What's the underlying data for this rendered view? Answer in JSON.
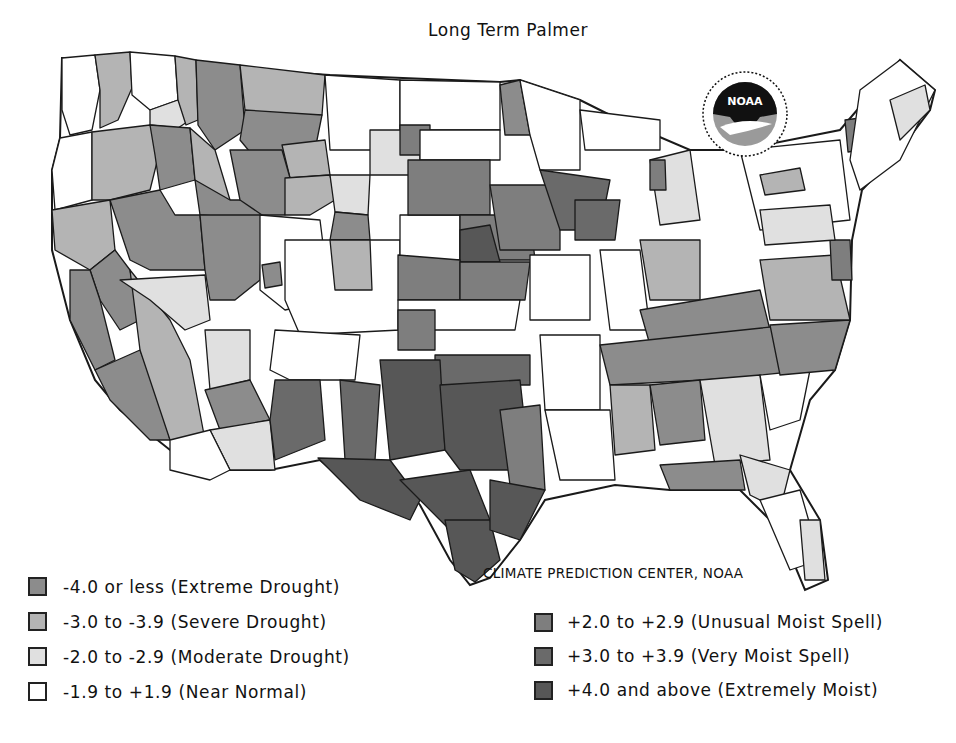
{
  "title": "Long Term Palmer",
  "credit": "CLIMATE PREDICTION CENTER, NOAA",
  "logo": {
    "name": "noaa-logo",
    "text": "NOAA"
  },
  "colors": {
    "extreme_drought": "#8c8c8c",
    "severe_drought": "#b4b4b4",
    "moderate_drought": "#e0e0e0",
    "near_normal": "#ffffff",
    "unusual_moist": "#7e7e7e",
    "very_moist": "#6a6a6a",
    "extremely_moist": "#575757",
    "border": "#1a1a1a"
  },
  "legend": {
    "left": [
      {
        "key": "extreme_drought",
        "label": "-4.0 or less (Extreme Drought)"
      },
      {
        "key": "severe_drought",
        "label": "-3.0 to -3.9 (Severe Drought)"
      },
      {
        "key": "moderate_drought",
        "label": "-2.0 to -2.9 (Moderate Drought)"
      },
      {
        "key": "near_normal",
        "label": "-1.9 to +1.9 (Near Normal)"
      }
    ],
    "right": [
      {
        "key": "unusual_moist",
        "label": "+2.0 to +2.9 (Unusual Moist Spell)"
      },
      {
        "key": "very_moist",
        "label": "+3.0 to +3.9 (Very Moist Spell)"
      },
      {
        "key": "extremely_moist",
        "label": "+4.0 and above (Extremely Moist)"
      }
    ]
  },
  "map_regions": [
    {
      "region": "washington-coast",
      "class": "near_normal",
      "points": "62,58 95,55 100,90 92,130 70,135 62,110"
    },
    {
      "region": "washington-cascades",
      "class": "severe_drought",
      "points": "95,55 130,52 132,88 118,120 100,128 100,90"
    },
    {
      "region": "washington-east",
      "class": "near_normal",
      "points": "130,52 175,56 178,100 150,110 132,95"
    },
    {
      "region": "washington-southeast",
      "class": "moderate_drought",
      "points": "150,110 178,100 190,120 178,128 150,125"
    },
    {
      "region": "idaho-panhandle",
      "class": "severe_drought",
      "points": "175,56 196,60 198,120 186,125 178,100"
    },
    {
      "region": "oregon-coast",
      "class": "near_normal",
      "points": "60,138 92,132 92,200 55,210 52,170"
    },
    {
      "region": "oregon-central",
      "class": "severe_drought",
      "points": "92,132 150,125 160,150 150,190 110,200 92,200"
    },
    {
      "region": "oregon-east",
      "class": "extreme_drought",
      "points": "150,125 190,128 195,180 160,190 155,155"
    },
    {
      "region": "montana-west",
      "class": "extreme_drought",
      "points": "196,60 240,65 245,130 215,150 198,125"
    },
    {
      "region": "montana-north",
      "class": "severe_drought",
      "points": "240,65 325,75 322,115 280,120 245,110"
    },
    {
      "region": "montana-central",
      "class": "extreme_drought",
      "points": "245,110 322,115 315,150 255,158 240,140"
    },
    {
      "region": "montana-east",
      "class": "severe_drought",
      "points": "282,145 325,140 330,175 290,178"
    },
    {
      "region": "idaho-central",
      "class": "severe_drought",
      "points": "190,128 215,150 230,200 205,200 195,180"
    },
    {
      "region": "idaho-south",
      "class": "extreme_drought",
      "points": "195,180 230,200 260,200 270,220 200,215"
    },
    {
      "region": "wyoming-west",
      "class": "extreme_drought",
      "points": "230,150 282,150 290,178 285,215 262,215 240,200"
    },
    {
      "region": "wyoming-central",
      "class": "severe_drought",
      "points": "285,178 330,175 335,200 310,215 285,215"
    },
    {
      "region": "wyoming-east",
      "class": "moderate_drought",
      "points": "330,175 370,175 368,215 335,212"
    },
    {
      "region": "wyoming-southeast",
      "class": "extreme_drought",
      "points": "335,212 368,215 370,240 330,240"
    },
    {
      "region": "california-north",
      "class": "severe_drought",
      "points": "52,210 110,200 115,250 90,270 55,250"
    },
    {
      "region": "california-sierra",
      "class": "extreme_drought",
      "points": "90,270 115,250 130,270 140,320 120,330 100,300"
    },
    {
      "region": "california-central-coast",
      "class": "extreme_drought",
      "points": "70,270 90,270 100,300 115,360 95,370 70,320"
    },
    {
      "region": "california-south-coast",
      "class": "extreme_drought",
      "points": "95,370 140,350 160,400 170,440 150,440 110,400"
    },
    {
      "region": "california-desert",
      "class": "severe_drought",
      "points": "130,270 170,320 190,360 205,440 170,440 140,350"
    },
    {
      "region": "nevada-north",
      "class": "extreme_drought",
      "points": "110,200 160,190 175,215 200,215 205,270 150,270 130,260"
    },
    {
      "region": "nevada-south",
      "class": "moderate_drought",
      "points": "120,280 205,275 210,320 185,330 150,300"
    },
    {
      "region": "utah-northwest",
      "class": "extreme_drought",
      "points": "200,215 262,215 260,280 235,300 210,300 205,270"
    },
    {
      "region": "utah-east",
      "class": "near_normal",
      "points": "260,215 320,220 330,300 285,310 260,290"
    },
    {
      "region": "utah-spot",
      "class": "extreme_drought",
      "points": "262,265 280,262 282,285 265,288"
    },
    {
      "region": "colorado-west",
      "class": "near_normal",
      "points": "285,240 400,240 400,330 300,335 285,300"
    },
    {
      "region": "colorado-northeast",
      "class": "severe_drought",
      "points": "330,240 370,240 372,290 335,290"
    },
    {
      "region": "arizona-north",
      "class": "moderate_drought",
      "points": "205,330 250,330 250,380 210,390"
    },
    {
      "region": "arizona-central",
      "class": "extreme_drought",
      "points": "205,390 250,380 270,420 220,430"
    },
    {
      "region": "arizona-south",
      "class": "moderate_drought",
      "points": "210,430 270,420 275,470 230,470"
    },
    {
      "region": "arizona-west",
      "class": "near_normal",
      "points": "170,440 210,430 230,470 210,480 170,470"
    },
    {
      "region": "new-mexico-north",
      "class": "near_normal",
      "points": "275,330 360,335 355,380 290,380 270,370"
    },
    {
      "region": "new-mexico-west",
      "class": "very_moist",
      "points": "275,380 320,380 325,440 275,460 270,420"
    },
    {
      "region": "new-mexico-east",
      "class": "very_moist",
      "points": "340,380 380,385 375,460 345,460"
    },
    {
      "region": "north-dakota-west",
      "class": "near_normal",
      "points": "325,75 400,80 400,150 330,150"
    },
    {
      "region": "north-dakota-east",
      "class": "near_normal",
      "points": "400,80 500,82 500,130 400,130"
    },
    {
      "region": "south-dakota-west",
      "class": "moderate_drought",
      "points": "370,130 420,130 420,175 370,175"
    },
    {
      "region": "south-dakota-spot",
      "class": "unusual_moist",
      "points": "400,125 430,125 430,155 400,155"
    },
    {
      "region": "south-dakota-east",
      "class": "near_normal",
      "points": "420,130 500,130 500,160 420,160"
    },
    {
      "region": "minnesota-northwest",
      "class": "extreme_drought",
      "points": "500,85 520,80 530,135 505,135"
    },
    {
      "region": "minnesota-east",
      "class": "near_normal",
      "points": "520,80 580,100 580,170 540,170 530,135"
    },
    {
      "region": "nebraska-west",
      "class": "near_normal",
      "points": "400,215 460,215 460,260 400,260"
    },
    {
      "region": "nebraska-central",
      "class": "unusual_moist",
      "points": "408,160 490,160 490,215 408,215"
    },
    {
      "region": "nebraska-east",
      "class": "unusual_moist",
      "points": "460,215 530,215 535,260 460,260"
    },
    {
      "region": "nebraska-deep",
      "class": "extremely_moist",
      "points": "460,230 490,225 500,262 460,262"
    },
    {
      "region": "iowa-west",
      "class": "unusual_moist",
      "points": "490,185 560,185 560,250 500,250"
    },
    {
      "region": "iowa-east",
      "class": "very_moist",
      "points": "540,170 610,180 600,230 560,230"
    },
    {
      "region": "wisconsin-west",
      "class": "very_moist",
      "points": "575,200 620,200 615,240 575,240"
    },
    {
      "region": "kansas-west",
      "class": "unusual_moist",
      "points": "398,255 460,260 460,300 398,300"
    },
    {
      "region": "kansas-east",
      "class": "unusual_moist",
      "points": "460,262 530,262 525,300 460,300"
    },
    {
      "region": "kansas-south",
      "class": "near_normal",
      "points": "398,300 520,300 515,330 398,330"
    },
    {
      "region": "oklahoma-panhandle",
      "class": "unusual_moist",
      "points": "398,310 435,310 435,350 398,350"
    },
    {
      "region": "missouri-north",
      "class": "near_normal",
      "points": "530,255 590,255 590,320 530,320"
    },
    {
      "region": "oklahoma-east",
      "class": "very_moist",
      "points": "435,355 530,355 530,385 435,385"
    },
    {
      "region": "texas-panhandle",
      "class": "extremely_moist",
      "points": "380,360 440,360 445,450 390,460"
    },
    {
      "region": "texas-central",
      "class": "extremely_moist",
      "points": "440,385 520,380 530,470 460,470 445,450"
    },
    {
      "region": "texas-west",
      "class": "extremely_moist",
      "points": "318,458 390,460 420,500 410,520 360,500"
    },
    {
      "region": "texas-southwest",
      "class": "extremely_moist",
      "points": "400,480 470,470 490,520 450,530"
    },
    {
      "region": "texas-south",
      "class": "extremely_moist",
      "points": "445,520 490,520 500,560 475,582 455,570"
    },
    {
      "region": "texas-east",
      "class": "unusual_moist",
      "points": "500,410 540,405 545,490 510,485"
    },
    {
      "region": "texas-gulf",
      "class": "extremely_moist",
      "points": "490,480 545,490 520,540 490,530"
    },
    {
      "region": "arkansas",
      "class": "near_normal",
      "points": "540,335 600,335 600,410 545,410"
    },
    {
      "region": "louisiana",
      "class": "near_normal",
      "points": "545,410 610,410 615,480 560,480"
    },
    {
      "region": "illinois",
      "class": "near_normal",
      "points": "600,250 640,250 650,330 610,330"
    },
    {
      "region": "indiana-ohio",
      "class": "severe_drought",
      "points": "640,240 700,240 700,300 650,300"
    },
    {
      "region": "kentucky",
      "class": "extreme_drought",
      "points": "640,310 760,290 770,330 650,345"
    },
    {
      "region": "tennessee",
      "class": "extreme_drought",
      "points": "600,345 790,325 795,375 610,385"
    },
    {
      "region": "mississippi",
      "class": "severe_drought",
      "points": "610,385 650,385 655,450 615,455"
    },
    {
      "region": "alabama",
      "class": "extreme_drought",
      "points": "650,385 700,380 705,440 660,445"
    },
    {
      "region": "georgia",
      "class": "moderate_drought",
      "points": "700,380 760,375 770,460 715,465"
    },
    {
      "region": "south-carolina",
      "class": "near_normal",
      "points": "760,375 810,370 800,420 770,430"
    },
    {
      "region": "north-carolina",
      "class": "extreme_drought",
      "points": "770,325 850,320 835,370 780,375"
    },
    {
      "region": "virginia",
      "class": "severe_drought",
      "points": "760,260 835,255 850,320 770,320"
    },
    {
      "region": "maryland-delaware",
      "class": "unusual_moist",
      "points": "830,240 850,240 852,280 832,280"
    },
    {
      "region": "florida-panhandle",
      "class": "extreme_drought",
      "points": "660,465 740,460 745,490 670,490"
    },
    {
      "region": "florida-north",
      "class": "moderate_drought",
      "points": "740,455 790,470 780,510 750,495"
    },
    {
      "region": "florida-peninsula",
      "class": "near_normal",
      "points": "760,500 800,490 820,560 790,570"
    },
    {
      "region": "florida-south",
      "class": "moderate_drought",
      "points": "800,520 820,520 825,580 805,580"
    },
    {
      "region": "michigan-upper",
      "class": "near_normal",
      "points": "580,110 660,120 660,150 585,150"
    },
    {
      "region": "michigan-lower",
      "class": "moderate_drought",
      "points": "650,160 690,150 700,220 660,225"
    },
    {
      "region": "michigan-spot",
      "class": "unusual_moist",
      "points": "650,160 665,160 666,190 650,190"
    },
    {
      "region": "new-york",
      "class": "near_normal",
      "points": "740,150 840,140 850,220 760,230"
    },
    {
      "region": "new-york-lakes",
      "class": "severe_drought",
      "points": "760,175 800,168 805,190 765,195"
    },
    {
      "region": "pennsylvania",
      "class": "moderate_drought",
      "points": "760,210 830,205 835,240 765,245"
    },
    {
      "region": "vermont",
      "class": "unusual_moist",
      "points": "845,120 860,118 862,150 848,152"
    },
    {
      "region": "new-england",
      "class": "near_normal",
      "points": "860,90 900,60 935,90 900,160 860,190 850,160"
    },
    {
      "region": "maine-coast",
      "class": "moderate_drought",
      "points": "890,100 925,85 930,110 900,140"
    }
  ]
}
